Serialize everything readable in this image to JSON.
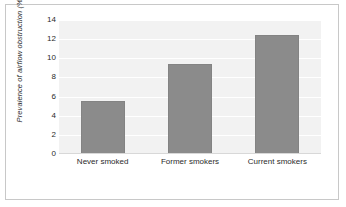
{
  "chart_data": {
    "type": "bar",
    "title": "",
    "subtitle": "",
    "xlabel": "",
    "ylabel": "Prevalence of airflow obstruction (%)",
    "categories": [
      "Never smoked",
      "Former smokers",
      "Current smokers"
    ],
    "values": [
      5.5,
      9.4,
      12.4
    ],
    "series": [
      {
        "name": "Prevalence of airflow obstruction",
        "values": [
          5.5,
          9.4,
          12.4
        ]
      }
    ],
    "ylim": [
      0,
      14
    ],
    "ytick_step": 2,
    "yticks": [
      14,
      12,
      10,
      8,
      6,
      4,
      2,
      0
    ],
    "ytick_labels": [
      "14",
      "12",
      "10",
      "8",
      "6",
      "4",
      "2",
      "0"
    ],
    "grid": true,
    "grid_axis": "y",
    "legend": false,
    "legend_position": "none",
    "bar_color": "#8b8b8b",
    "bar_edge_color": "#838383",
    "plot_background": "#f2f2f2",
    "gridline_color": "#ffffff",
    "frame_border_color": "#c8c8c8",
    "text_color": "#2b2b2b",
    "annotations": []
  }
}
